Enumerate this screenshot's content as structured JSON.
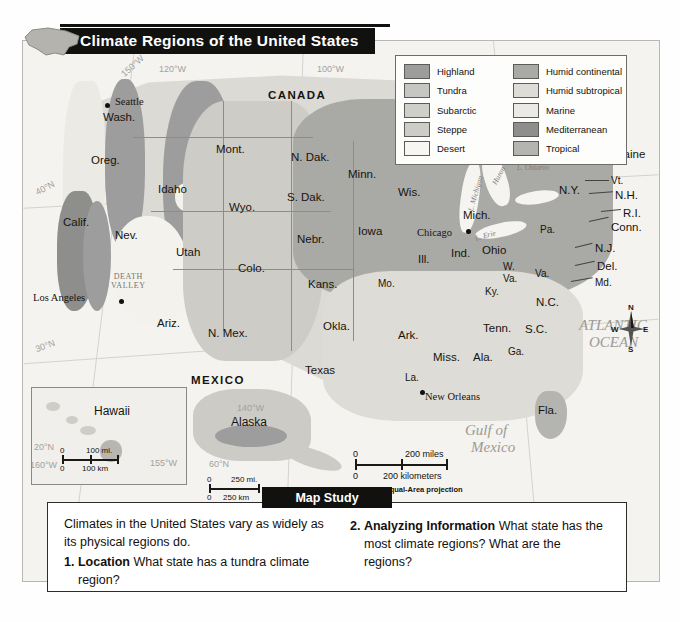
{
  "title": "Climate Regions of the United States",
  "legend": {
    "columns": [
      [
        {
          "label": "Highland",
          "color": "#9d9d9d"
        },
        {
          "label": "Tundra",
          "color": "#c6c6c2"
        },
        {
          "label": "Subarctic",
          "color": "#cfcfca"
        },
        {
          "label": "Steppe",
          "color": "#cdccc6"
        },
        {
          "label": "Desert",
          "color": "#f7f6f2"
        }
      ],
      [
        {
          "label": "Humid continental",
          "color": "#a9a9a6"
        },
        {
          "label": "Humid subtropical",
          "color": "#dedcd6"
        },
        {
          "label": "Marine",
          "color": "#eceae4"
        },
        {
          "label": "Mediterranean",
          "color": "#8e8e8c"
        },
        {
          "label": "Tropical",
          "color": "#b4b4b0"
        }
      ]
    ]
  },
  "countries": [
    {
      "name": "CANADA",
      "x": 245,
      "y": 48
    },
    {
      "name": "MEXICO",
      "x": 168,
      "y": 333
    }
  ],
  "states": [
    {
      "name": "Wash.",
      "x": 80,
      "y": 70
    },
    {
      "name": "Oreg.",
      "x": 68,
      "y": 113
    },
    {
      "name": "Calif.",
      "x": 40,
      "y": 175
    },
    {
      "name": "Nev.",
      "x": 92,
      "y": 188
    },
    {
      "name": "Idaho",
      "x": 135,
      "y": 142
    },
    {
      "name": "Mont.",
      "x": 193,
      "y": 102
    },
    {
      "name": "Wyo.",
      "x": 206,
      "y": 160
    },
    {
      "name": "Utah",
      "x": 153,
      "y": 205
    },
    {
      "name": "Colo.",
      "x": 215,
      "y": 221
    },
    {
      "name": "Ariz.",
      "x": 134,
      "y": 276
    },
    {
      "name": "N. Mex.",
      "x": 185,
      "y": 286
    },
    {
      "name": "N. Dak.",
      "x": 268,
      "y": 110
    },
    {
      "name": "S. Dak.",
      "x": 264,
      "y": 150
    },
    {
      "name": "Nebr.",
      "x": 274,
      "y": 192
    },
    {
      "name": "Kans.",
      "x": 285,
      "y": 237
    },
    {
      "name": "Okla.",
      "x": 300,
      "y": 279
    },
    {
      "name": "Texas",
      "x": 282,
      "y": 323
    },
    {
      "name": "Minn.",
      "x": 325,
      "y": 127
    },
    {
      "name": "Iowa",
      "x": 335,
      "y": 184
    },
    {
      "name": "Mo.",
      "x": 355,
      "y": 237
    },
    {
      "name": "Ark.",
      "x": 375,
      "y": 288
    },
    {
      "name": "La.",
      "x": 382,
      "y": 331
    },
    {
      "name": "Wis.",
      "x": 375,
      "y": 145
    },
    {
      "name": "Ill.",
      "x": 395,
      "y": 212
    },
    {
      "name": "Miss.",
      "x": 410,
      "y": 310
    },
    {
      "name": "Ala.",
      "x": 450,
      "y": 310
    },
    {
      "name": "Mich.",
      "x": 440,
      "y": 168
    },
    {
      "name": "Ind.",
      "x": 428,
      "y": 206
    },
    {
      "name": "Ohio",
      "x": 459,
      "y": 203
    },
    {
      "name": "Ky.",
      "x": 462,
      "y": 245
    },
    {
      "name": "Tenn.",
      "x": 460,
      "y": 281
    },
    {
      "name": "Ga.",
      "x": 485,
      "y": 305
    },
    {
      "name": "Fla.",
      "x": 515,
      "y": 363
    },
    {
      "name": "S.C.",
      "x": 502,
      "y": 282
    },
    {
      "name": "N.C.",
      "x": 513,
      "y": 255
    },
    {
      "name": "W.",
      "x": 480,
      "y": 220
    },
    {
      "name": "Va.",
      "x": 480,
      "y": 232
    },
    {
      "name": "Va.",
      "x": 512,
      "y": 227
    },
    {
      "name": "Pa.",
      "x": 517,
      "y": 183
    },
    {
      "name": "N.Y.",
      "x": 536,
      "y": 143
    },
    {
      "name": "Maine",
      "x": 591,
      "y": 107
    },
    {
      "name": "Vt.",
      "x": 588,
      "y": 134
    },
    {
      "name": "N.H.",
      "x": 592,
      "y": 148
    },
    {
      "name": "R.I.",
      "x": 600,
      "y": 166
    },
    {
      "name": "Conn.",
      "x": 588,
      "y": 180
    },
    {
      "name": "N.J.",
      "x": 572,
      "y": 201
    },
    {
      "name": "Del.",
      "x": 574,
      "y": 219
    },
    {
      "name": "Md.",
      "x": 572,
      "y": 236
    }
  ],
  "cities": [
    {
      "name": "Seattle",
      "x": 88,
      "y": 62,
      "dx": 75,
      "dy": 64
    },
    {
      "name": "Los Angeles",
      "x": 8,
      "y": 258,
      "dx": 85,
      "dy": 262
    },
    {
      "name": "Chicago",
      "x": 394,
      "y": 191,
      "dx": 444,
      "dy": 191
    },
    {
      "name": "Chicago-label-only",
      "x": -999,
      "y": -999,
      "dx": -999,
      "dy": -999
    }
  ],
  "city_labels": [
    {
      "name": "Seattle",
      "x": 92,
      "y": 58,
      "dotx": 82,
      "doty": 62
    },
    {
      "name": "Los Angeles",
      "x": 8,
      "y": 252,
      "dotx": 96,
      "doty": 258
    },
    {
      "name": "Chicago",
      "x": 395,
      "y": 186,
      "dotx": 443,
      "doty": 188
    },
    {
      "name": "New Orleans",
      "x": 400,
      "y": 352,
      "dotx": 398,
      "doty": 350
    }
  ],
  "water_labels": [
    {
      "name": "ATLANTIC",
      "x": 556,
      "y": 283
    },
    {
      "name": "OCEAN",
      "x": 566,
      "y": 300
    },
    {
      "name": "Gulf of",
      "x": 442,
      "y": 387
    },
    {
      "name": "Mexico",
      "x": 448,
      "y": 403
    }
  ],
  "lakes": [
    {
      "name": "L. Michigan",
      "x": 444,
      "y": 150,
      "rot": 72
    },
    {
      "name": "Huron",
      "x": 470,
      "y": 133,
      "rot": 62
    },
    {
      "name": "L. Erie",
      "x": 455,
      "y": 192,
      "rot": -22
    },
    {
      "name": "L. Ontario",
      "x": 495,
      "y": 124,
      "rot": 0
    }
  ],
  "grid_labels": [
    {
      "name": "150°W",
      "x": 96,
      "y": 23
    },
    {
      "name": "120°W",
      "x": 135,
      "y": 25
    },
    {
      "name": "100°W",
      "x": 295,
      "y": 25
    },
    {
      "name": "40°N",
      "x": 8,
      "y": 146
    },
    {
      "name": "30°N",
      "x": 8,
      "y": 302
    }
  ],
  "inset_grid_labels": [
    {
      "name": "20°N",
      "x": 10,
      "y": 404
    },
    {
      "name": "160°W",
      "x": 4,
      "y": 422
    },
    {
      "name": "155°W",
      "x": 130,
      "y": 420
    },
    {
      "name": "140°W",
      "x": 213,
      "y": 365
    },
    {
      "name": "60°N",
      "x": 185,
      "y": 420
    }
  ],
  "death_valley": {
    "line1": "DEATH",
    "line2": "VALLEY",
    "x": 100,
    "y": 238
  },
  "insets": [
    {
      "name": "Hawaii",
      "label_x": 62,
      "label_y": 375
    },
    {
      "name": "Alaska",
      "label_x": 168,
      "label_y": 408
    }
  ],
  "scales": {
    "main": {
      "miles": "200 miles",
      "km": "200 kilometers",
      "zero": "0",
      "projection": "Lambert Equal-Area projection"
    },
    "hawaii": {
      "miles": "100 mi.",
      "km": "100 km",
      "zero": "0"
    },
    "alaska": {
      "miles": "250 mi.",
      "km": "250 km",
      "zero": "0"
    }
  },
  "compass": {
    "n": "N",
    "e": "E",
    "s": "S",
    "w": "W"
  },
  "map_study": {
    "tab_label": "Map Study",
    "intro": "Climates in the United States vary as widely as its physical regions do.",
    "questions": [
      {
        "num": "1.",
        "term": "Location",
        "text": "What state has a tundra climate region?"
      },
      {
        "num": "2.",
        "term": "Analyzing Information",
        "text": "What state has the most climate regions?  What are the regions?"
      }
    ]
  }
}
